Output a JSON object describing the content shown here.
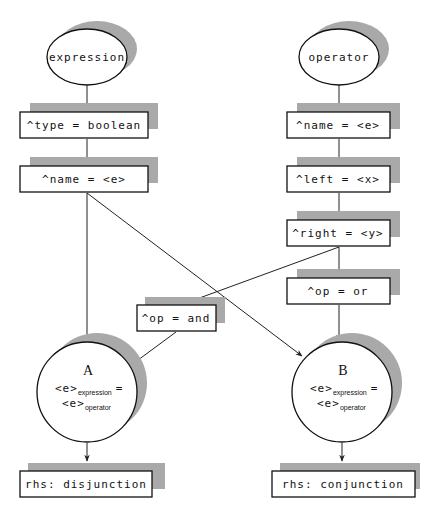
{
  "diagram": {
    "type": "rete-network",
    "roots": [
      {
        "id": "expression",
        "label": "expression",
        "shape": "ellipse"
      },
      {
        "id": "operator",
        "label": "operator",
        "shape": "ellipse"
      }
    ],
    "tests": {
      "expr_type": "^type = boolean",
      "expr_name": "^name = <e>",
      "op_name": "^name = <e>",
      "op_left": "^left = <x>",
      "op_right": "^right = <y>",
      "op_or": "^op = or",
      "op_and": "^op = and"
    },
    "joins": [
      {
        "id": "A",
        "label": "A",
        "lhs_var": "<e>",
        "lhs_sub": "expression",
        "eq": "=",
        "rhs_var": "<e>",
        "rhs_sub": "operator"
      },
      {
        "id": "B",
        "label": "B",
        "lhs_var": "<e>",
        "lhs_sub": "expression",
        "eq": "=",
        "rhs_var": "<e>",
        "rhs_sub": "operator"
      }
    ],
    "productions": {
      "left": "rhs: disjunction",
      "right": "rhs: conjunction"
    },
    "edges": [
      [
        "expression",
        "expr_type"
      ],
      [
        "expr_type",
        "expr_name"
      ],
      [
        "expr_name",
        "A"
      ],
      [
        "expr_name",
        "B"
      ],
      [
        "operator",
        "op_name"
      ],
      [
        "op_name",
        "op_left"
      ],
      [
        "op_left",
        "op_right"
      ],
      [
        "op_right",
        "op_or"
      ],
      [
        "op_right",
        "op_and"
      ],
      [
        "op_and",
        "A"
      ],
      [
        "op_or",
        "B"
      ],
      [
        "A",
        "left_production"
      ],
      [
        "B",
        "right_production"
      ]
    ],
    "colors": {
      "shadow": "#a9a9a9",
      "stroke": "#111111",
      "background": "#ffffff"
    }
  }
}
